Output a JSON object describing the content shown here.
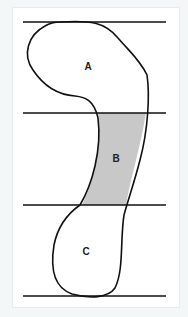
{
  "diagram": {
    "regions": [
      {
        "id": "A",
        "label": "A",
        "fill": "#ffffff"
      },
      {
        "id": "B",
        "label": "B",
        "fill": "#c8c8c8"
      },
      {
        "id": "C",
        "label": "C",
        "fill": "#ffffff"
      }
    ],
    "horizontal_lines": 4,
    "colors": {
      "stroke": "#111111",
      "shaded": "#c8c8c8",
      "background": "#ffffff"
    }
  }
}
